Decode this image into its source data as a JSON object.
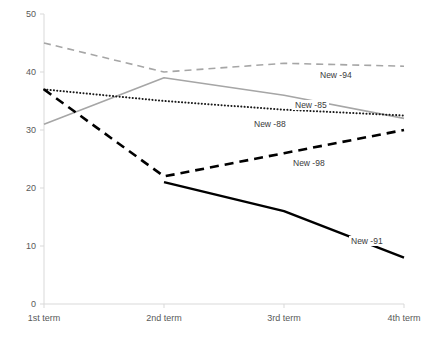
{
  "chart_data": {
    "type": "line",
    "title": "",
    "xlabel": "",
    "ylabel": "",
    "categories": [
      "1st term",
      "2nd term",
      "3rd term",
      "4th term"
    ],
    "yticks": [
      0,
      10,
      20,
      30,
      40,
      50
    ],
    "ylim": [
      0,
      50
    ],
    "grid": false,
    "legend": "inline-labels",
    "series": [
      {
        "name": "New -94",
        "label": "New -94",
        "color": "#a6a6a6",
        "style": "dashed",
        "width": 1.6,
        "values": [
          45,
          40,
          41.5,
          41
        ],
        "label_x": 318,
        "label_y": 70
      },
      {
        "name": "New -85",
        "label": "New -85",
        "color": "#a6a6a6",
        "style": "solid",
        "width": 1.6,
        "values": [
          31,
          39,
          36,
          32
        ],
        "label_x": 293,
        "label_y": 100
      },
      {
        "name": "New -88",
        "label": "New -88",
        "color": "#1a1a1a",
        "style": "dotted",
        "width": 2.0,
        "values": [
          37,
          35,
          33.5,
          32.5
        ],
        "label_x": 252,
        "label_y": 119
      },
      {
        "name": "New -98",
        "label": "New -98",
        "color": "#000000",
        "style": "heavy-dashed",
        "width": 2.6,
        "values": [
          37,
          22,
          26,
          30
        ],
        "label_x": 291,
        "label_y": 158
      },
      {
        "name": "New -91",
        "label": "New -91",
        "color": "#000000",
        "style": "solid",
        "width": 2.4,
        "values": [
          null,
          21,
          16,
          8
        ],
        "label_x": 349,
        "label_y": 236
      }
    ],
    "axis_color": "#d9d9d9",
    "tick_text_color": "#595959"
  }
}
